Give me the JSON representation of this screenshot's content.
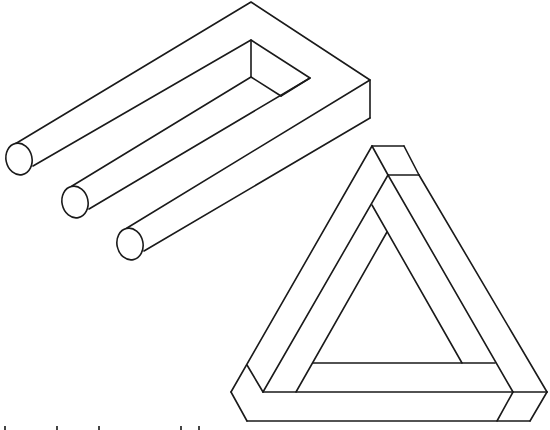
{
  "figure": {
    "stroke_color": "#1a1a1a",
    "background_color": "#ffffff"
  },
  "impossible_fork": {
    "label": "Impossible trident (blivet)",
    "prong_count": 3,
    "outline": {
      "top_vertex": [
        251,
        2
      ],
      "right_corner": [
        370,
        80
      ],
      "right_bottom": [
        370,
        118
      ],
      "inner_apex": [
        251,
        40
      ],
      "inner_right": [
        310,
        78
      ],
      "inner_bottom_left": [
        251,
        77
      ],
      "inner_bottom_right": [
        281,
        96
      ]
    },
    "prongs": [
      {
        "end_center": [
          19,
          159
        ],
        "rx": 13,
        "ry": 16,
        "top_tangent": [
          15,
          144
        ],
        "bottom_tangent": [
          33,
          166
        ]
      },
      {
        "end_center": [
          75,
          202
        ],
        "rx": 13,
        "ry": 16,
        "top_tangent": [
          72,
          186
        ],
        "bottom_tangent": [
          89,
          209
        ]
      },
      {
        "end_center": [
          130,
          244
        ],
        "rx": 13,
        "ry": 16,
        "top_tangent": [
          127,
          228
        ],
        "bottom_tangent": [
          144,
          251
        ]
      }
    ]
  },
  "penrose_triangle": {
    "label": "Penrose triangle",
    "segments": [
      [
        [
          372,
          146
        ],
        [
          231,
          392
        ]
      ],
      [
        [
          372,
          146
        ],
        [
          404,
          146
        ]
      ],
      [
        [
          404,
          146
        ],
        [
          419,
          175
        ]
      ],
      [
        [
          372,
          146
        ],
        [
          388,
          175
        ]
      ],
      [
        [
          388,
          175
        ],
        [
          419,
          175
        ]
      ],
      [
        [
          419,
          175
        ],
        [
          547,
          392
        ]
      ],
      [
        [
          388,
          175
        ],
        [
          263,
          392
        ]
      ],
      [
        [
          388,
          175
        ],
        [
          513,
          392
        ]
      ],
      [
        [
          372,
          205
        ],
        [
          462,
          363
        ]
      ],
      [
        [
          387,
          232
        ],
        [
          296,
          392
        ]
      ],
      [
        [
          313,
          363
        ],
        [
          495,
          363
        ]
      ],
      [
        [
          231,
          392
        ],
        [
          247,
          421
        ]
      ],
      [
        [
          247,
          365
        ],
        [
          263,
          392
        ]
      ],
      [
        [
          247,
          421
        ],
        [
          530,
          421
        ]
      ],
      [
        [
          530,
          421
        ],
        [
          547,
          392
        ]
      ],
      [
        [
          263,
          392
        ],
        [
          547,
          392
        ]
      ],
      [
        [
          513,
          392
        ],
        [
          497,
          421
        ]
      ]
    ]
  },
  "caption": {
    "text": "",
    "note": "clipped at bottom edge, unreadable"
  }
}
